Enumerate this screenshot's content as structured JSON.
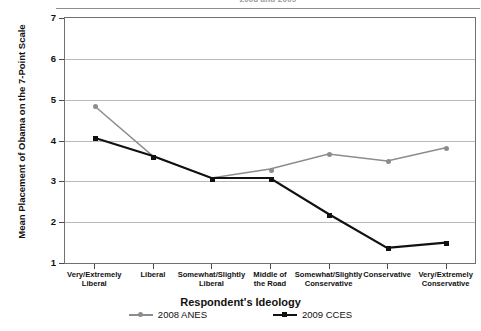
{
  "figure": {
    "title": "2008 and 2009",
    "xlabel": "Respondent's Ideology",
    "ylabel": "Mean Placement of Obama on the 7-Point Scale"
  },
  "legend": {
    "items": [
      {
        "label": "2008 ANES",
        "color": "#8c8c8c",
        "marker": "circle"
      },
      {
        "label": "2009 CCES",
        "color": "#111111",
        "marker": "square"
      }
    ]
  },
  "axis": {
    "yticks": [
      "1",
      "2",
      "3",
      "4",
      "5",
      "6",
      "7"
    ]
  },
  "chart_data": {
    "type": "line",
    "title": "2008 and 2009",
    "xlabel": "Respondent's Ideology",
    "ylabel": "Mean Placement of Obama on the 7-Point Scale",
    "categories": [
      "Very/Extremely Liberal",
      "Liberal",
      "Somewhat/Slightly Liberal",
      "Middle of the Road",
      "Somewhat/Slightly Conservative",
      "Conservative",
      "Very/Extremely Conservative"
    ],
    "category_lines": [
      [
        "Very/Extremely",
        "Liberal"
      ],
      [
        "Liberal"
      ],
      [
        "Somewhat/Slightly",
        "Liberal"
      ],
      [
        "Middle of",
        "the Road"
      ],
      [
        "Somewhat/Slightly",
        "Conservative"
      ],
      [
        "Conservative"
      ],
      [
        "Very/Extremely",
        "Conservative"
      ]
    ],
    "series": [
      {
        "name": "2008 ANES",
        "color": "#8c8c8c",
        "marker": "circle",
        "values": [
          4.85,
          3.62,
          3.08,
          3.3,
          3.67,
          3.5,
          3.82
        ]
      },
      {
        "name": "2009 CCES",
        "color": "#111111",
        "marker": "square",
        "values": [
          4.07,
          3.62,
          3.08,
          3.08,
          2.2,
          1.37,
          1.5
        ]
      }
    ],
    "ylim": [
      1,
      7
    ],
    "yticks": [
      1,
      2,
      3,
      4,
      5,
      6,
      7
    ],
    "grid": true,
    "legend_position": "bottom"
  }
}
